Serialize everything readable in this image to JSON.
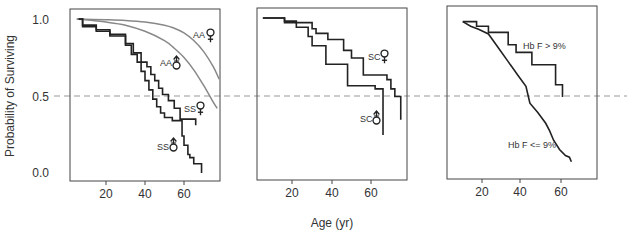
{
  "chart_data": [
    {
      "type": "line",
      "panel": 1,
      "title": "",
      "xlabel": "",
      "ylabel": "Probability of Surviving",
      "xticks": [
        20,
        40,
        60
      ],
      "yticks": [
        0.0,
        0.5,
        1.0
      ],
      "ytick_labels": [
        "0.0",
        "0.5",
        "1.0"
      ],
      "xlim": [
        0,
        78
      ],
      "ylim": [
        0,
        1.05
      ],
      "reference_line": 0.5,
      "series": [
        {
          "name": "AA female",
          "label": "AA",
          "symbol": "female",
          "color": "#888888",
          "style": "smooth",
          "x": [
            5,
            20,
            30,
            40,
            50,
            55,
            60,
            65,
            70,
            75,
            78
          ],
          "y": [
            1.0,
            0.995,
            0.99,
            0.98,
            0.96,
            0.94,
            0.91,
            0.86,
            0.79,
            0.69,
            0.61
          ]
        },
        {
          "name": "AA male",
          "label": "AA",
          "symbol": "male",
          "color": "#888888",
          "style": "smooth",
          "x": [
            5,
            20,
            30,
            40,
            50,
            55,
            60,
            65,
            70,
            75,
            77
          ],
          "y": [
            1.0,
            0.98,
            0.96,
            0.92,
            0.86,
            0.81,
            0.75,
            0.67,
            0.57,
            0.46,
            0.42
          ]
        },
        {
          "name": "SS female",
          "label": "SS",
          "symbol": "female",
          "color": "#222222",
          "style": "step",
          "x": [
            6,
            8,
            15,
            22,
            30,
            34,
            38,
            41,
            43,
            45,
            47,
            49,
            52,
            55,
            58,
            62,
            66
          ],
          "y": [
            1.0,
            0.96,
            0.93,
            0.9,
            0.84,
            0.78,
            0.72,
            0.69,
            0.64,
            0.6,
            0.55,
            0.51,
            0.47,
            0.42,
            0.35,
            0.35,
            0.31
          ]
        },
        {
          "name": "SS male",
          "label": "SS",
          "symbol": "male",
          "color": "#222222",
          "style": "step",
          "x": [
            6,
            8,
            15,
            22,
            30,
            33,
            36,
            38,
            40,
            42,
            44,
            46,
            48,
            50,
            52,
            54,
            57,
            59,
            60,
            62,
            63,
            65,
            68,
            69
          ],
          "y": [
            1.0,
            0.95,
            0.92,
            0.89,
            0.83,
            0.77,
            0.72,
            0.66,
            0.6,
            0.54,
            0.48,
            0.43,
            0.39,
            0.36,
            0.36,
            0.34,
            0.34,
            0.24,
            0.18,
            0.12,
            0.1,
            0.06,
            0.06,
            0.0
          ]
        }
      ]
    },
    {
      "type": "line",
      "panel": 2,
      "title": "",
      "xlabel": "Age (yr)",
      "ylabel": "",
      "xticks": [
        20,
        40,
        60
      ],
      "xlim": [
        0,
        78
      ],
      "ylim": [
        0,
        1.05
      ],
      "reference_line": 0.5,
      "series": [
        {
          "name": "SC female",
          "label": "SC",
          "symbol": "female",
          "color": "#222222",
          "style": "step",
          "x": [
            5,
            16,
            22,
            30,
            32,
            38,
            46,
            50,
            56,
            68,
            70,
            72,
            75
          ],
          "y": [
            1.0,
            0.98,
            0.97,
            0.93,
            0.9,
            0.86,
            0.79,
            0.74,
            0.63,
            0.6,
            0.54,
            0.49,
            0.34
          ]
        },
        {
          "name": "SC male",
          "label": "SC",
          "symbol": "male",
          "color": "#222222",
          "style": "step",
          "x": [
            5,
            16,
            22,
            28,
            30,
            37,
            48,
            62,
            66
          ],
          "y": [
            1.0,
            0.97,
            0.94,
            0.88,
            0.82,
            0.7,
            0.56,
            0.54,
            0.24
          ]
        }
      ]
    },
    {
      "type": "line",
      "panel": 3,
      "title": "",
      "xlabel": "",
      "ylabel": "",
      "xticks": [
        20,
        40,
        60
      ],
      "xlim": [
        0,
        78
      ],
      "ylim": [
        0,
        1.05
      ],
      "reference_line": 0.5,
      "series": [
        {
          "name": "Hb F > 9%",
          "label": "Hb F > 9%",
          "color": "#222222",
          "style": "step",
          "x": [
            10,
            17,
            23,
            33,
            37,
            45,
            57,
            60,
            60.5
          ],
          "y": [
            0.97,
            0.94,
            0.9,
            0.82,
            0.77,
            0.69,
            0.56,
            0.56,
            0.48
          ]
        },
        {
          "name": "Hb F <= 9%",
          "label": "Hb F <= 9%",
          "color": "#222222",
          "style": "line",
          "x": [
            10,
            14,
            18,
            23,
            28,
            33,
            38,
            42,
            44,
            48,
            52,
            54,
            56,
            59,
            62,
            64,
            65
          ],
          "y": [
            0.97,
            0.94,
            0.92,
            0.89,
            0.8,
            0.71,
            0.62,
            0.55,
            0.44,
            0.38,
            0.31,
            0.26,
            0.2,
            0.14,
            0.1,
            0.09,
            0.06
          ]
        }
      ]
    }
  ],
  "labels": {
    "ylabel": "Probability of Surviving",
    "xlabel": "Age (yr)",
    "ytick_1": "1.0",
    "ytick_05": "0.5",
    "ytick_0": "0.0",
    "xtick_20": "20",
    "xtick_40": "40",
    "xtick_60": "60",
    "aa": "AA",
    "ss": "SS",
    "sc": "SC",
    "hbf_high": "Hb F > 9%",
    "hbf_low": "Hb F <= 9%"
  },
  "colors": {
    "axis": "#333333",
    "black_curve": "#222222",
    "gray_curve": "#8a8a8a",
    "reference_line": "#999999",
    "text": "#333333"
  }
}
